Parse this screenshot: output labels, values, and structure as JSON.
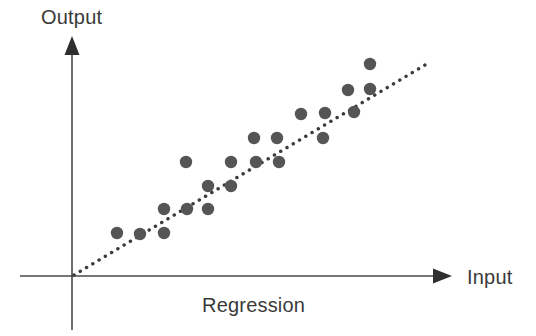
{
  "figure": {
    "width": 536,
    "height": 336,
    "background": "#ffffff"
  },
  "labels": {
    "y_axis": "Output",
    "x_axis": "Input",
    "caption": "Regression"
  },
  "colors": {
    "axis": "#4a4a4a",
    "point": "#555555",
    "trendline": "#3c3c3c",
    "text": "#3a3a3a"
  },
  "chart_data": {
    "type": "scatter",
    "title": "Regression",
    "xlabel": "Input",
    "ylabel": "Output",
    "grid": false,
    "legend": null,
    "axis_style": "arrow-axes-no-ticks",
    "xlim": [
      0,
      1
    ],
    "ylim": [
      0,
      1
    ],
    "points": [
      {
        "x": 0.104,
        "y": 0.185
      },
      {
        "x": 0.166,
        "y": 0.181
      },
      {
        "x": 0.23,
        "y": 0.185
      },
      {
        "x": 0.23,
        "y": 0.286
      },
      {
        "x": 0.292,
        "y": 0.286
      },
      {
        "x": 0.349,
        "y": 0.286
      },
      {
        "x": 0.349,
        "y": 0.385
      },
      {
        "x": 0.411,
        "y": 0.385
      },
      {
        "x": 0.352,
        "y": 0.489
      },
      {
        "x": 0.474,
        "y": 0.489
      },
      {
        "x": 0.542,
        "y": 0.489
      },
      {
        "x": 0.605,
        "y": 0.489
      },
      {
        "x": 0.539,
        "y": 0.594
      },
      {
        "x": 0.602,
        "y": 0.594
      },
      {
        "x": 0.728,
        "y": 0.594
      },
      {
        "x": 0.668,
        "y": 0.7
      },
      {
        "x": 0.734,
        "y": 0.704
      },
      {
        "x": 0.813,
        "y": 0.708
      },
      {
        "x": 0.797,
        "y": 0.806
      },
      {
        "x": 0.857,
        "y": 0.81
      },
      {
        "x": 0.857,
        "y": 0.919
      }
    ],
    "trendline": {
      "style": "dotted",
      "from": {
        "x": 0.0,
        "y": 0.0
      },
      "to": {
        "x": 0.975,
        "y": 0.929
      }
    }
  },
  "geometry": {
    "origin": {
      "x": 72,
      "y": 276
    },
    "y_axis": {
      "x": 72,
      "top": 38,
      "bottom": 330
    },
    "x_axis": {
      "y": 276,
      "left": 20,
      "right": 452
    },
    "point_radius": 6.2,
    "pixel_points": [
      [
        117,
        233
      ],
      [
        140,
        234
      ],
      [
        164,
        233
      ],
      [
        164,
        209
      ],
      [
        187,
        209
      ],
      [
        208,
        209
      ],
      [
        208,
        186
      ],
      [
        231,
        186
      ],
      [
        186,
        162
      ],
      [
        231,
        162
      ],
      [
        256,
        162
      ],
      [
        279,
        162
      ],
      [
        254,
        138
      ],
      [
        277,
        138
      ],
      [
        323,
        138
      ],
      [
        301,
        114
      ],
      [
        325,
        113
      ],
      [
        354,
        112
      ],
      [
        348,
        90
      ],
      [
        370,
        89
      ],
      [
        370,
        64
      ]
    ],
    "trendline_pixels": {
      "x1": 74,
      "y1": 275,
      "x2": 430,
      "y2": 62
    }
  }
}
